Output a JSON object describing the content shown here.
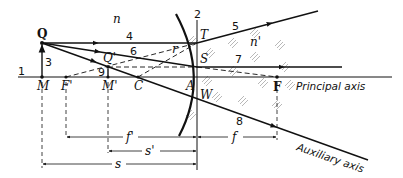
{
  "figure": {
    "media_labels": {
      "left": "n",
      "right": "n'"
    },
    "points": {
      "Q": "Q",
      "Q_prime": "Q'",
      "M": "M",
      "M_prime": "M'",
      "F_prime": "F'",
      "F": "F",
      "C": "C",
      "A": "A",
      "T": "T",
      "S": "S",
      "W": "W"
    },
    "ray_numbers": {
      "r1": "1",
      "r2": "2",
      "r3": "3",
      "r4": "4",
      "r5": "5",
      "r6": "6",
      "r7": "7",
      "r8": "8",
      "r9": "9"
    },
    "angle_label": "r",
    "axes": {
      "principal": "Principal axis",
      "auxiliary": "Auxiliary axis"
    },
    "dimensions": {
      "f_prime": "f'",
      "s_prime": "s'",
      "s": "s",
      "f": "f"
    },
    "colors": {
      "ink": "#111111",
      "hatch": "#777777",
      "background": "#ffffff"
    }
  }
}
